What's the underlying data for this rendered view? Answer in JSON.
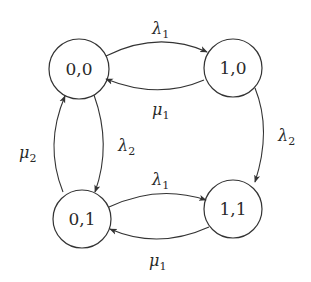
{
  "diagram": {
    "type": "state-transition",
    "colors": {
      "stroke": "#333333",
      "text": "#2a2a2a",
      "background": "#ffffff"
    },
    "states": [
      {
        "id": "s00",
        "label": "0,0"
      },
      {
        "id": "s10",
        "label": "1,0"
      },
      {
        "id": "s01",
        "label": "0,1"
      },
      {
        "id": "s11",
        "label": "1,1"
      }
    ],
    "edges": [
      {
        "from": "0,0",
        "to": "1,0",
        "symbol": "λ",
        "sub": "1"
      },
      {
        "from": "1,0",
        "to": "0,0",
        "symbol": "μ",
        "sub": "1"
      },
      {
        "from": "1,0",
        "to": "1,1",
        "symbol": "λ",
        "sub": "2"
      },
      {
        "from": "0,0",
        "to": "0,1",
        "symbol": "λ",
        "sub": "2"
      },
      {
        "from": "0,1",
        "to": "0,0",
        "symbol": "μ",
        "sub": "2"
      },
      {
        "from": "0,1",
        "to": "1,1",
        "symbol": "λ",
        "sub": "1"
      },
      {
        "from": "1,1",
        "to": "0,1",
        "symbol": "μ",
        "sub": "1"
      }
    ]
  }
}
